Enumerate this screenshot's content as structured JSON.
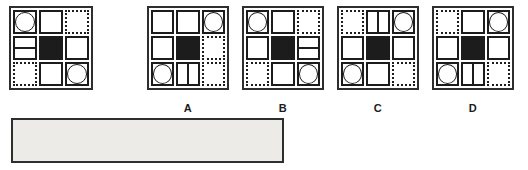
{
  "puzzle": {
    "question_grid": {
      "rows": [
        [
          "circle",
          "empty",
          "dotted"
        ],
        [
          "hsplit",
          "black",
          "empty"
        ],
        [
          "dotted",
          "empty",
          "circle"
        ]
      ]
    },
    "options": [
      {
        "label": "A",
        "rows": [
          [
            "empty",
            "empty",
            "circle"
          ],
          [
            "empty",
            "black",
            "dotted"
          ],
          [
            "circle",
            "vsplit",
            "dotted"
          ]
        ]
      },
      {
        "label": "B",
        "rows": [
          [
            "circle",
            "empty",
            "dotted"
          ],
          [
            "empty",
            "black",
            "hsplit"
          ],
          [
            "dotted",
            "empty",
            "circle"
          ]
        ]
      },
      {
        "label": "C",
        "rows": [
          [
            "dotted",
            "vsplit",
            "circle"
          ],
          [
            "empty",
            "black",
            "empty"
          ],
          [
            "circle",
            "empty",
            "dotted"
          ]
        ]
      },
      {
        "label": "D",
        "rows": [
          [
            "dotted",
            "empty",
            "circle"
          ],
          [
            "empty",
            "black",
            "empty"
          ],
          [
            "circle",
            "vsplit",
            "dotted"
          ]
        ]
      }
    ],
    "answer_box": {
      "value": ""
    },
    "cell_glyphs": {
      "circle": "circle-in-square-icon",
      "empty": "empty-square-solid-border-icon",
      "dotted": "empty-square-dotted-border-icon",
      "black": "filled-black-square-icon",
      "hsplit": "square-split-horizontal-icon",
      "vsplit": "square-split-vertical-icon"
    }
  },
  "colors": {
    "ink": "#1c1c1c",
    "frame": "#2e2e2e",
    "answer_fill": "#ecebe8",
    "bg": "#ffffff"
  }
}
